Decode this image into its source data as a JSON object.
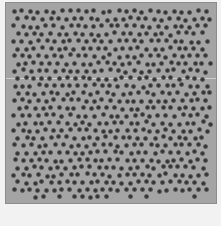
{
  "image": {
    "description": "Grayscale micrograph of a near-hexagonal lattice of dark dots",
    "colors": {
      "page_background": "#f2f2f2",
      "field_background": "#a4a4a4",
      "dot_color": "#2a2a2a",
      "seam_color": "#d8d8d8"
    },
    "lattice": {
      "rows": 26,
      "columns": 26,
      "spacing_px": 8,
      "dot_diameter_px": 5
    }
  }
}
